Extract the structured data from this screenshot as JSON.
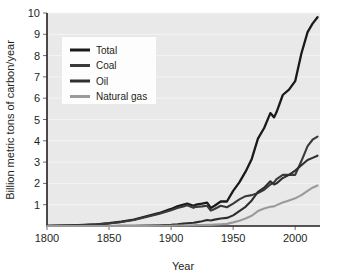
{
  "chart_data": {
    "type": "line",
    "title": "",
    "xlabel": "Year",
    "ylabel": "Billion metric tons of carbon/year",
    "xlim": [
      1800,
      2020
    ],
    "ylim": [
      0,
      10
    ],
    "grid": true,
    "legend_position": "upper-left",
    "xticks": [
      "1800",
      "1850",
      "1900",
      "1950",
      "2000"
    ],
    "xtick_values": [
      1800,
      1850,
      1900,
      1950,
      2000
    ],
    "yticks": [
      "1",
      "2",
      "3",
      "4",
      "5",
      "6",
      "7",
      "8",
      "9",
      "10"
    ],
    "ytick_values": [
      1,
      2,
      3,
      4,
      5,
      6,
      7,
      8,
      9,
      10
    ],
    "x": [
      1800,
      1810,
      1820,
      1830,
      1840,
      1850,
      1860,
      1870,
      1880,
      1890,
      1900,
      1905,
      1910,
      1913,
      1918,
      1920,
      1925,
      1929,
      1932,
      1935,
      1940,
      1945,
      1950,
      1955,
      1960,
      1965,
      1970,
      1975,
      1980,
      1983,
      1985,
      1990,
      1995,
      2000,
      2005,
      2010,
      2014,
      2018
    ],
    "series": [
      {
        "name": "Total",
        "color": "#1a1a1a",
        "values": [
          0.01,
          0.02,
          0.03,
          0.05,
          0.08,
          0.13,
          0.2,
          0.3,
          0.45,
          0.6,
          0.8,
          0.92,
          1.0,
          1.05,
          0.95,
          1.0,
          1.05,
          1.1,
          0.85,
          0.95,
          1.15,
          1.15,
          1.65,
          2.05,
          2.55,
          3.15,
          4.1,
          4.6,
          5.3,
          5.1,
          5.35,
          6.15,
          6.4,
          6.8,
          8.1,
          9.1,
          9.5,
          9.8
        ]
      },
      {
        "name": "Coal",
        "color": "#3a3a3a",
        "values": [
          0.01,
          0.02,
          0.03,
          0.05,
          0.08,
          0.12,
          0.19,
          0.28,
          0.42,
          0.56,
          0.74,
          0.85,
          0.92,
          0.97,
          0.85,
          0.9,
          0.92,
          0.95,
          0.72,
          0.8,
          0.95,
          0.88,
          1.05,
          1.25,
          1.4,
          1.45,
          1.55,
          1.7,
          1.95,
          2.05,
          2.2,
          2.4,
          2.4,
          2.4,
          3.05,
          3.75,
          4.05,
          4.2
        ]
      },
      {
        "name": "Oil",
        "color": "#2e2e2e",
        "values": [
          0,
          0,
          0,
          0,
          0,
          0,
          0.005,
          0.01,
          0.02,
          0.035,
          0.06,
          0.08,
          0.11,
          0.13,
          0.15,
          0.17,
          0.22,
          0.28,
          0.26,
          0.3,
          0.35,
          0.38,
          0.5,
          0.7,
          0.9,
          1.2,
          1.6,
          1.8,
          2.1,
          1.95,
          2.0,
          2.25,
          2.4,
          2.6,
          2.85,
          3.1,
          3.2,
          3.3
        ]
      },
      {
        "name": "Natural gas",
        "color": "#9a9a9a",
        "values": [
          0,
          0,
          0,
          0,
          0,
          0,
          0,
          0.002,
          0.005,
          0.01,
          0.015,
          0.02,
          0.025,
          0.03,
          0.035,
          0.04,
          0.05,
          0.06,
          0.055,
          0.065,
          0.08,
          0.1,
          0.17,
          0.25,
          0.35,
          0.48,
          0.7,
          0.82,
          0.9,
          0.92,
          0.98,
          1.1,
          1.2,
          1.3,
          1.45,
          1.65,
          1.8,
          1.9
        ]
      }
    ]
  },
  "legend": {
    "items": [
      {
        "label": "Total"
      },
      {
        "label": "Coal"
      },
      {
        "label": "Oil"
      },
      {
        "label": "Natural gas"
      }
    ]
  }
}
